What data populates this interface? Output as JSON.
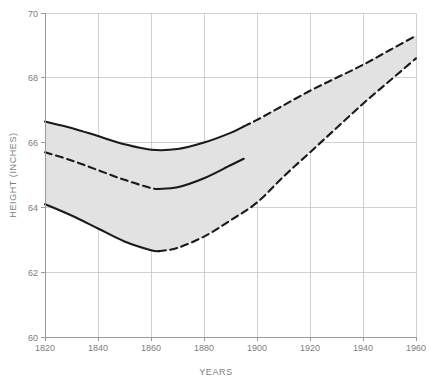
{
  "chart_data": {
    "type": "line",
    "title": "",
    "subtitle": "",
    "xlabel": "YEARS",
    "ylabel": "HEIGHT (INCHES)",
    "xlim": [
      1820,
      1960
    ],
    "ylim": [
      60,
      70
    ],
    "xticks": [
      1820,
      1840,
      1860,
      1880,
      1900,
      1920,
      1940,
      1960
    ],
    "yticks": [
      60,
      62,
      64,
      66,
      68,
      70
    ],
    "xtick_labels": [
      "1820",
      "1840",
      "1860",
      "1880",
      "1900",
      "1920",
      "1940",
      "1960"
    ],
    "ytick_labels": [
      "60",
      "62",
      "64",
      "66",
      "68",
      "70"
    ],
    "grid": true,
    "legend": "none",
    "shaded_band": {
      "name": "range between upper and lower bound",
      "fill_color": "#e2e2e2",
      "upper_series": "upper_bound",
      "lower_series": "lower_bound"
    },
    "series": [
      {
        "name": "upper_bound",
        "color": "#1a1a1a",
        "style": "solid-then-dashed",
        "solid_until_x": 1895,
        "x": [
          1820,
          1830,
          1840,
          1850,
          1860,
          1870,
          1880,
          1890,
          1895,
          1900,
          1910,
          1920,
          1930,
          1940,
          1950,
          1960
        ],
        "y": [
          66.65,
          66.45,
          66.2,
          65.95,
          65.78,
          65.8,
          66.0,
          66.3,
          66.5,
          66.7,
          67.15,
          67.6,
          68.0,
          68.4,
          68.85,
          69.3
        ]
      },
      {
        "name": "middle_line",
        "color": "#1a1a1a",
        "style": "dashed-then-solid",
        "dashed_until_x": 1863,
        "x": [
          1820,
          1830,
          1840,
          1850,
          1860,
          1863,
          1870,
          1880,
          1890,
          1895
        ],
        "y": [
          65.7,
          65.45,
          65.15,
          64.85,
          64.6,
          64.57,
          64.62,
          64.9,
          65.3,
          65.5
        ]
      },
      {
        "name": "lower_bound",
        "color": "#1a1a1a",
        "style": "solid-then-dashed",
        "solid_until_x": 1863,
        "x": [
          1820,
          1830,
          1840,
          1850,
          1860,
          1863,
          1870,
          1880,
          1890,
          1900,
          1910,
          1920,
          1930,
          1940,
          1950,
          1960
        ],
        "y": [
          64.1,
          63.75,
          63.35,
          62.95,
          62.68,
          62.65,
          62.75,
          63.1,
          63.6,
          64.15,
          64.95,
          65.7,
          66.45,
          67.2,
          67.9,
          68.6
        ]
      }
    ]
  }
}
